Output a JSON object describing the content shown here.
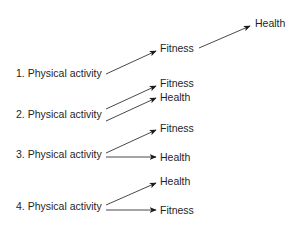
{
  "diagram": {
    "type": "causal-model-comparison",
    "models": [
      {
        "number": "1.",
        "source": "1. Physical activity",
        "structure": "chain",
        "nodes": [
          {
            "id": "fitness",
            "label": "Fitness"
          },
          {
            "id": "health",
            "label": "Health"
          }
        ],
        "edges": [
          {
            "from": "Physical activity",
            "to": "Fitness"
          },
          {
            "from": "Fitness",
            "to": "Health"
          }
        ]
      },
      {
        "number": "2.",
        "source": "2. Physical activity",
        "structure": "parallel",
        "nodes": [
          {
            "id": "fitness",
            "label": "Fitness"
          },
          {
            "id": "health",
            "label": "Health"
          }
        ],
        "edges": [
          {
            "from": "Physical activity",
            "to": "Fitness"
          },
          {
            "from": "Physical activity",
            "to": "Health"
          }
        ]
      },
      {
        "number": "3.",
        "source": "3. Physical activity",
        "structure": "fork",
        "nodes": [
          {
            "id": "fitness",
            "label": "Fitness"
          },
          {
            "id": "health",
            "label": "Health"
          }
        ],
        "edges": [
          {
            "from": "Physical activity",
            "to": "Fitness"
          },
          {
            "from": "Physical activity",
            "to": "Health"
          }
        ]
      },
      {
        "number": "4.",
        "source": "4. Physical activity",
        "structure": "fork",
        "nodes": [
          {
            "id": "health",
            "label": "Health"
          },
          {
            "id": "fitness",
            "label": "Fitness"
          }
        ],
        "edges": [
          {
            "from": "Physical activity",
            "to": "Health"
          },
          {
            "from": "Physical activity",
            "to": "Fitness"
          }
        ]
      }
    ]
  },
  "colors": {
    "text": "#1f1f1f",
    "arrow": "#1a1a1a",
    "background": "#ffffff"
  }
}
